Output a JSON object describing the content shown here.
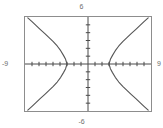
{
  "graph": {
    "labels": {
      "top": "6",
      "bottom": "-6",
      "left": "-9",
      "right": "9"
    },
    "colors": {
      "frame": "#8d8d8d",
      "axis": "#4a4a4a",
      "curve": "#555555",
      "label_text": "#6d6d6d",
      "background": "#ffffff"
    }
  },
  "chart_data": {
    "type": "line",
    "title": "",
    "xlabel": "",
    "ylabel": "",
    "xlim": [
      -9,
      9
    ],
    "ylim": [
      -6,
      6
    ],
    "grid": false,
    "legend": "none",
    "axis_ticks": {
      "x_step": 1,
      "y_step": 1,
      "x_ticks": [
        -8,
        -7,
        -6,
        -5,
        -4,
        -3,
        -2,
        -1,
        1,
        2,
        3,
        4,
        5,
        6,
        7,
        8
      ],
      "y_ticks": [
        -5,
        -4,
        -3,
        -2,
        -1,
        1,
        2,
        3,
        4,
        5
      ]
    },
    "window_labels": {
      "xmin": "-9",
      "xmax": "9",
      "ymin": "-6",
      "ymax": "6"
    },
    "series": [
      {
        "name": "left-branch",
        "x": [
          -8.6,
          -8.0,
          -7.4,
          -6.8,
          -6.2,
          -5.6,
          -5.0,
          -4.4,
          -3.9,
          -3.5,
          -3.2,
          -3.0
        ],
        "y": [
          5.9,
          5.4,
          4.9,
          4.4,
          3.9,
          3.4,
          2.9,
          2.3,
          1.7,
          1.1,
          0.6,
          0.0
        ]
      },
      {
        "name": "left-branch-lower",
        "x": [
          -3.0,
          -3.2,
          -3.5,
          -3.9,
          -4.4,
          -5.0,
          -5.6,
          -6.2,
          -6.8,
          -7.4,
          -8.0,
          -8.6
        ],
        "y": [
          0.0,
          -0.6,
          -1.1,
          -1.7,
          -2.3,
          -2.9,
          -3.4,
          -3.9,
          -4.4,
          -4.9,
          -5.4,
          -5.9
        ]
      },
      {
        "name": "right-branch",
        "x": [
          3.0,
          3.2,
          3.5,
          3.9,
          4.4,
          5.0,
          5.6,
          6.2,
          6.8,
          7.4,
          8.0,
          8.6
        ],
        "y": [
          0.0,
          0.6,
          1.1,
          1.7,
          2.3,
          2.9,
          3.4,
          3.9,
          4.4,
          4.9,
          5.4,
          5.9
        ]
      },
      {
        "name": "right-branch-lower",
        "x": [
          3.0,
          3.2,
          3.5,
          3.9,
          4.4,
          5.0,
          5.6,
          6.2,
          6.8,
          7.4,
          8.0,
          8.6
        ],
        "y": [
          0.0,
          -0.6,
          -1.1,
          -1.7,
          -2.3,
          -2.9,
          -3.4,
          -3.9,
          -4.4,
          -4.9,
          -5.4,
          -5.9
        ]
      }
    ]
  }
}
